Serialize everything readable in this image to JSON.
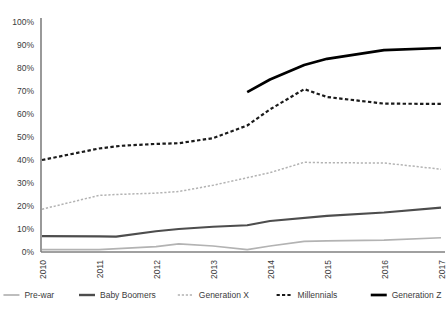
{
  "chart_data": {
    "type": "line",
    "title": "",
    "subtitle": "",
    "xlabel": "",
    "ylabel": "",
    "grid": false,
    "legend_position": "bottom",
    "x": [
      "2010",
      "2011",
      "2012",
      "2013",
      "2014",
      "2015",
      "2016",
      "2017"
    ],
    "x_tick_labels": [
      "2010",
      "2011",
      "2012",
      "2013",
      "2014",
      "2015",
      "2016",
      "2017"
    ],
    "x_tick_rotation": -90,
    "y_tick_labels": [
      "0%",
      "10%",
      "20%",
      "30%",
      "40%",
      "50%",
      "60%",
      "70%",
      "80%",
      "90%",
      "100%"
    ],
    "y_tick_values": [
      0,
      10,
      20,
      30,
      40,
      50,
      60,
      70,
      80,
      90,
      100
    ],
    "ylim": [
      0,
      100
    ],
    "xlim": [
      2010,
      2017
    ],
    "y_unit": "%",
    "series": [
      {
        "name": "Pre-war",
        "color": "#b3b3b3",
        "width": 1.7,
        "dash": "none",
        "x": [
          2010,
          2011,
          2012,
          2012.4,
          2013,
          2013.6,
          2014,
          2014.6,
          2015,
          2016,
          2017
        ],
        "values": [
          1.0,
          1.0,
          2.3,
          3.5,
          2.6,
          1.0,
          2.6,
          4.6,
          4.8,
          5.2,
          6.2
        ]
      },
      {
        "name": "Baby Boomers",
        "color": "#4d4d4d",
        "width": 2.1,
        "dash": "none",
        "x": [
          2010,
          2011,
          2011.3,
          2012,
          2012.4,
          2013,
          2013.6,
          2014,
          2015,
          2016,
          2017
        ],
        "values": [
          6.9,
          6.8,
          6.7,
          9.0,
          10.0,
          11.0,
          11.6,
          13.5,
          15.7,
          17.2,
          19.3
        ]
      },
      {
        "name": "Generation X",
        "color": "#b3b3b3",
        "width": 1.5,
        "dash": "2.2 1.8",
        "x": [
          2010,
          2011,
          2011.3,
          2012,
          2012.4,
          2013,
          2014,
          2014.6,
          2015,
          2016,
          2017
        ],
        "values": [
          18.6,
          24.6,
          25.0,
          25.6,
          26.3,
          29.0,
          34.5,
          39.0,
          38.8,
          38.7,
          36.0
        ]
      },
      {
        "name": "Millennials",
        "color": "#1a1a1a",
        "width": 2.2,
        "dash": "3.4 2.4",
        "x": [
          2010,
          2011,
          2011.4,
          2012,
          2012.4,
          2013,
          2013.6,
          2014,
          2014.6,
          2015,
          2016,
          2017
        ],
        "values": [
          40.0,
          45.0,
          46.2,
          47.0,
          47.3,
          49.5,
          55.0,
          62.0,
          70.8,
          67.4,
          64.5,
          64.4
        ]
      },
      {
        "name": "Generation Z",
        "color": "#000000",
        "width": 2.7,
        "dash": "none",
        "x": [
          2013.6,
          2014,
          2014.6,
          2015,
          2016,
          2017
        ],
        "values": [
          69.5,
          75.0,
          81.3,
          84.0,
          87.8,
          88.7
        ]
      }
    ]
  },
  "legend": {
    "items": [
      {
        "label": "Pre-war",
        "color": "#b3b3b3",
        "width": 1.7,
        "dash": "none"
      },
      {
        "label": "Baby Boomers",
        "color": "#4d4d4d",
        "width": 2.4,
        "dash": "none"
      },
      {
        "label": "Generation X",
        "color": "#b3b3b3",
        "width": 1.5,
        "dash": "2.2 1.8"
      },
      {
        "label": "Millennials",
        "color": "#1a1a1a",
        "width": 2.2,
        "dash": "3.2 2.2"
      },
      {
        "label": "Generation Z",
        "color": "#000000",
        "width": 2.7,
        "dash": "none"
      }
    ]
  },
  "axis": {
    "line_color": "#808080",
    "label_color": "#3b3b3b"
  }
}
